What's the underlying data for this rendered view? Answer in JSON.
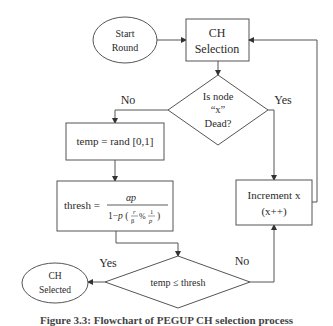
{
  "diagram": {
    "nodes": {
      "start": {
        "line1": "Start",
        "line2": "Round"
      },
      "ch_selection": {
        "line1": "CH",
        "line2": "Selection"
      },
      "is_dead": {
        "line1": "Is node",
        "line2": "“x”",
        "line3": "Dead?"
      },
      "temp_rand": {
        "label": "temp = rand [0,1]"
      },
      "thresh": {
        "lhs": "thresh =",
        "numerator": "αp",
        "denominator": "1−p (r/β % 1/p)"
      },
      "increment": {
        "line1": "Increment  x",
        "line2": "(x++)"
      },
      "compare": {
        "label": "temp ≤ thresh"
      },
      "ch_selected": {
        "line1": "CH",
        "line2": "Selected"
      }
    },
    "edge_labels": {
      "dead_no": "No",
      "dead_yes": "Yes",
      "compare_yes": "Yes",
      "compare_no": "No"
    },
    "colors": {
      "stroke": "#555555",
      "text": "#2a2a2a",
      "background": "#ffffff"
    }
  },
  "caption": "Figure 3.3:  Flowchart of PEGUP CH selection process"
}
